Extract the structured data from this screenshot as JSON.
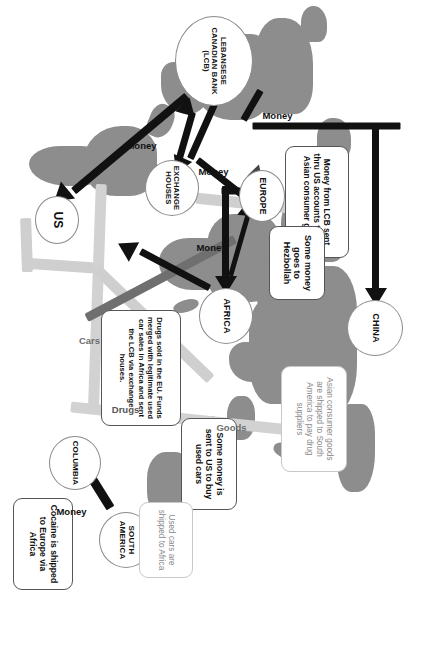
{
  "diagram": {
    "type": "flow-map",
    "orientation_deg": 90,
    "colors": {
      "land": "#8d8d8d",
      "ocean": "#ffffff",
      "money_arrow": "#111111",
      "drugs_flow": "#6f6f6f",
      "goods_flow": "#d2d2d2",
      "cars_flow": "#cfcfcf",
      "node_fill": "#ffffff",
      "node_stroke": "#8a8a8a",
      "callout_border": "#555555",
      "callout_light_text": "#8a8a8a"
    },
    "nodes": [
      {
        "id": "china",
        "label": "CHINA"
      },
      {
        "id": "europe",
        "label": "EUROPE"
      },
      {
        "id": "lcb",
        "label": "LEBANSESE CANADIAN BANK (LCB)"
      },
      {
        "id": "exchange",
        "label": "EXCHANGE HOUSES"
      },
      {
        "id": "africa",
        "label": "AFRICA"
      },
      {
        "id": "us",
        "label": "US"
      },
      {
        "id": "columbia",
        "label": "COLUMBIA"
      },
      {
        "id": "south_america",
        "label": "SOUTH AMERICA"
      }
    ],
    "callouts": [
      {
        "id": "lcb-to-asia",
        "text": "Money from LCB sent thru US accounts to buy Asian consumer goods",
        "style": "bold"
      },
      {
        "id": "asian-goods",
        "text": "Asian consumer goods are shipped to South America to pay drug suppliers",
        "style": "light"
      },
      {
        "id": "hezbollah",
        "text": "Some money goes to Hezbollah",
        "style": "bold"
      },
      {
        "id": "eu-drugs",
        "text": "Drugs sold in the EU. Funds merged with legitimate used car sales in Africa and sent the LCB via exchange houses.",
        "style": "bold"
      },
      {
        "id": "used-cars-us",
        "text": "Some money is sent to US to buy used cars",
        "style": "bold"
      },
      {
        "id": "cocaine",
        "text": "Cocaine is shipped to Europe via Africa",
        "style": "bold"
      },
      {
        "id": "used-cars-afr",
        "text": "Used cars are shipped to Africa",
        "style": "light"
      }
    ],
    "edge_labels": [
      {
        "id": "money-lcb-china",
        "text": "Money"
      },
      {
        "id": "money-lcb-exchange",
        "text": "Money"
      },
      {
        "id": "money-exchange-afr",
        "text": "Money"
      },
      {
        "id": "money-lcb-us",
        "text": "Money"
      },
      {
        "id": "money-sa-columbia",
        "text": "Money"
      },
      {
        "id": "goods-china-sa",
        "text": "Goods"
      },
      {
        "id": "drugs-columbia-afr",
        "text": "Drugs"
      },
      {
        "id": "cars-us-africa",
        "text": "Cars"
      }
    ]
  }
}
